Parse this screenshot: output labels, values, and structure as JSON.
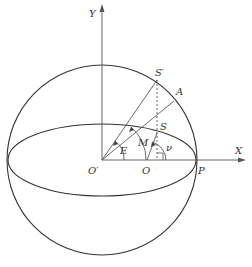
{
  "labels": {
    "y_axis": "Y",
    "x_axis": "X",
    "s_prime": "S′",
    "a": "A",
    "s": "S",
    "o_prime": "O′",
    "o": "O",
    "p": "P",
    "e": "E",
    "m": "M",
    "nu": "ν"
  },
  "colors": {
    "line": "#333333",
    "axis": "#555555"
  }
}
